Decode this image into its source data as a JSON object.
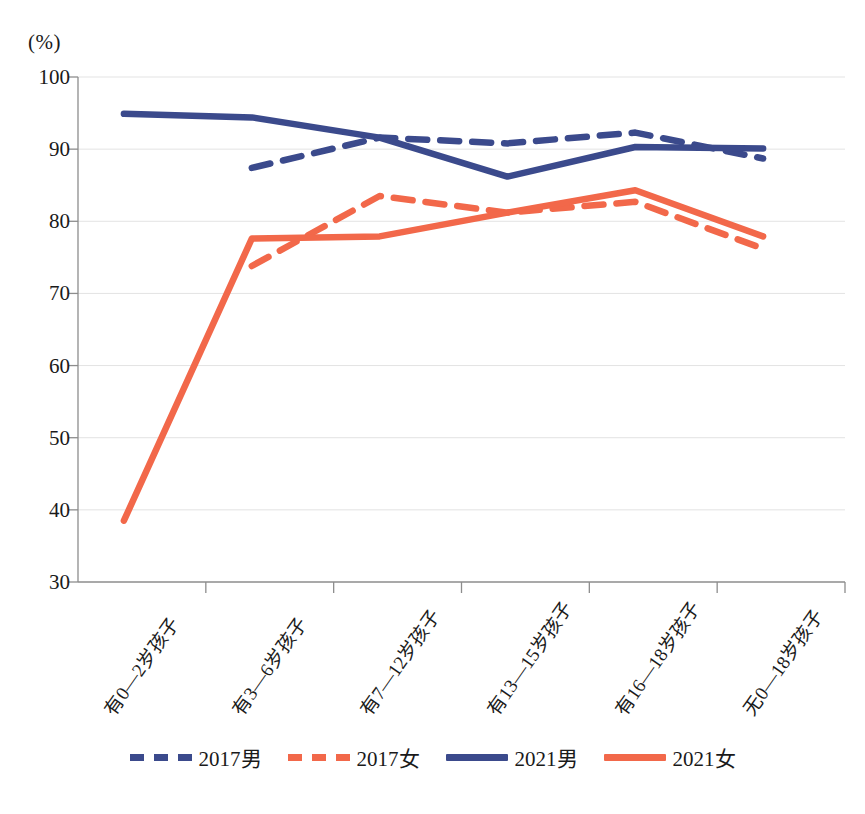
{
  "chart_data": {
    "type": "line",
    "title": "",
    "xlabel": "",
    "ylabel": "(%)",
    "ylim": [
      30,
      100
    ],
    "ytick_step": 10,
    "yticks": [
      100,
      90,
      80,
      70,
      60,
      50,
      40,
      30
    ],
    "grid": true,
    "legend_position": "bottom",
    "categories": [
      "有0—2岁孩子",
      "有3—6岁孩子",
      "有7—12岁孩子",
      "有13—15岁孩子",
      "有16—18岁孩子",
      "无0—18岁孩子"
    ],
    "series": [
      {
        "name": "2017男",
        "color": "#3b4a8c",
        "style": "dashed",
        "values": [
          null,
          87.4,
          91.6,
          90.8,
          92.3,
          88.7
        ]
      },
      {
        "name": "2017女",
        "color": "#f2684a",
        "style": "dashed",
        "values": [
          null,
          73.8,
          83.5,
          81.2,
          82.7,
          76.2
        ]
      },
      {
        "name": "2021男",
        "color": "#3b4a8c",
        "style": "solid",
        "values": [
          94.9,
          94.4,
          91.6,
          86.2,
          90.3,
          90.1
        ]
      },
      {
        "name": "2021女",
        "color": "#f2684a",
        "style": "solid",
        "values": [
          38.5,
          77.6,
          77.9,
          81.2,
          84.3,
          77.9
        ]
      }
    ]
  },
  "axis": {
    "unit_label": "(%)"
  },
  "caption": ""
}
